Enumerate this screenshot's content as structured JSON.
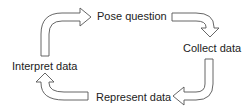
{
  "diagram": {
    "type": "cycle",
    "stages": [
      {
        "label": "Pose question"
      },
      {
        "label": "Collect data"
      },
      {
        "label": "Represent data"
      },
      {
        "label": "Interpret data"
      }
    ],
    "arrows": [
      {
        "from": "Interpret data",
        "to": "Pose question",
        "icon": "curved-arrow-right-icon"
      },
      {
        "from": "Pose question",
        "to": "Collect data",
        "icon": "curved-arrow-down-icon"
      },
      {
        "from": "Collect data",
        "to": "Represent data",
        "icon": "curved-arrow-left-icon"
      },
      {
        "from": "Represent data",
        "to": "Interpret data",
        "icon": "curved-arrow-up-icon"
      }
    ],
    "colors": {
      "arrow_outline": "#555555",
      "arrow_fill": "#ffffff",
      "text": "#222222",
      "background": "#ffffff"
    }
  }
}
